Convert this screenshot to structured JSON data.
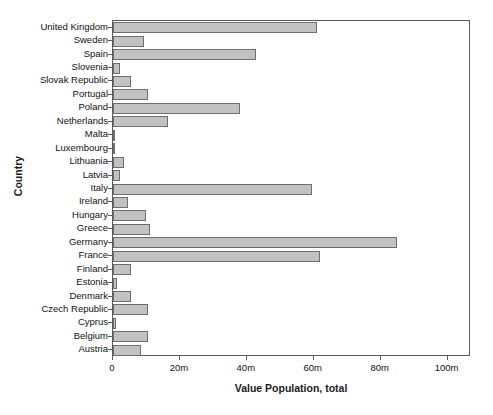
{
  "chart_data": {
    "type": "bar",
    "orientation": "horizontal",
    "title": "",
    "xlabel": "Value Population, total",
    "ylabel": "Country",
    "annotation": "m = million",
    "xlim": [
      0,
      107
    ],
    "xticks": [
      0,
      20,
      40,
      60,
      80,
      100
    ],
    "xticklabels": [
      "0",
      "20m",
      "40m",
      "60m",
      "80m",
      "100m"
    ],
    "grid": false,
    "legend": null,
    "bar_color": "#c2c2c2",
    "bar_edge_color": "#6e6e6e",
    "frame_color": "#5a5a5a",
    "units": "millions",
    "categories": [
      "United Kingdom",
      "Sweden",
      "Spain",
      "Slovenia",
      "Slovak Republic",
      "Portugal",
      "Poland",
      "Netherlands",
      "Malta",
      "Luxembourg",
      "Lithuania",
      "Latvia",
      "Italy",
      "Ireland",
      "Hungary",
      "Greece",
      "Germany",
      "France",
      "Finland",
      "Estonia",
      "Denmark",
      "Czech Republic",
      "Cyprus",
      "Belgium",
      "Austria"
    ],
    "values": [
      61.0,
      9.3,
      42.7,
      2.0,
      5.4,
      10.6,
      38.1,
      16.5,
      0.4,
      0.5,
      3.3,
      2.2,
      59.6,
      4.4,
      10.0,
      11.2,
      85.0,
      62.0,
      5.3,
      1.3,
      5.5,
      10.4,
      0.8,
      10.6,
      8.3
    ]
  }
}
